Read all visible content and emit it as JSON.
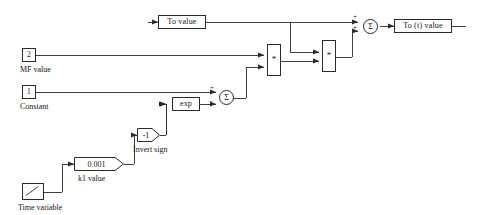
{
  "diagram": {
    "background_color": "#ffffff",
    "line_color": "#2b2b2b",
    "blocks": {
      "to_value": {
        "label": "To  value",
        "type": "signal-block"
      },
      "to_t_value": {
        "label": "To (t)  value",
        "type": "signal-block"
      },
      "mf_value_port": {
        "label": "2",
        "caption": "MF value",
        "type": "inport"
      },
      "constant_port": {
        "label": "1",
        "caption": "Constant",
        "type": "inport"
      },
      "exp_block": {
        "label": "exp",
        "type": "math-function"
      },
      "invert_sign_gain": {
        "label": "-1",
        "caption": "Invert sign",
        "type": "gain"
      },
      "k1_gain": {
        "label": "0.001",
        "caption": "k1 value",
        "type": "gain"
      },
      "time_variable": {
        "label": "",
        "caption": "Time variable",
        "type": "clock"
      },
      "product_1": {
        "label": "*",
        "type": "product"
      },
      "product_2": {
        "label": "*",
        "type": "product"
      },
      "sum_1": {
        "label": "Σ",
        "type": "sum",
        "signs": [
          "+",
          "−"
        ]
      },
      "sum_2": {
        "label": "Σ",
        "type": "sum",
        "signs": [
          "+",
          "+"
        ]
      }
    },
    "signs": {
      "plus": "+",
      "minus": "−",
      "sigma": "Σ",
      "asterisk": "*"
    }
  }
}
